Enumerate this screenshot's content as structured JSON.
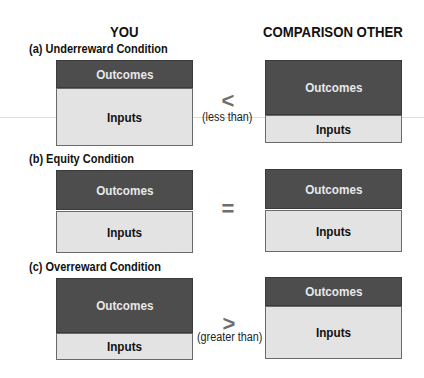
{
  "headers": {
    "you": "YOU",
    "other": "COMPARISON OTHER"
  },
  "conditions": [
    {
      "title": "(a) Underreward Condition",
      "you": {
        "outcomes": "Outcomes",
        "inputs": "Inputs"
      },
      "operator": {
        "symbol": "<",
        "label": "(less than)"
      },
      "other": {
        "outcomes": "Outcomes",
        "inputs": "Inputs"
      }
    },
    {
      "title": "(b) Equity Condition",
      "you": {
        "outcomes": "Outcomes",
        "inputs": "Inputs"
      },
      "operator": {
        "symbol": "=",
        "label": ""
      },
      "other": {
        "outcomes": "Outcomes",
        "inputs": "Inputs"
      }
    },
    {
      "title": "(c) Overreward Condition",
      "you": {
        "outcomes": "Outcomes",
        "inputs": "Inputs"
      },
      "operator": {
        "symbol": ">",
        "label": "(greater than)"
      },
      "other": {
        "outcomes": "Outcomes",
        "inputs": "Inputs"
      }
    }
  ],
  "colors": {
    "outcomes_fill": "#4d4d4d",
    "inputs_fill": "#e3e3e3",
    "operator": "#6e6e6e"
  }
}
